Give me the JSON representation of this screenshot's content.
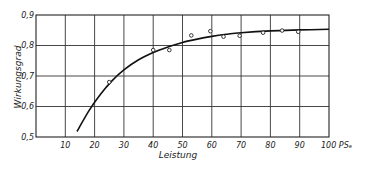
{
  "chart_data": {
    "type": "scatter",
    "title": "",
    "xlabel": "Leistung",
    "ylabel": "Wirkungsgrad",
    "x_unit_label": "PSe",
    "xlim": [
      0,
      100
    ],
    "ylim": [
      0.5,
      0.9
    ],
    "x_ticks": [
      10,
      20,
      30,
      40,
      50,
      60,
      70,
      80,
      90,
      100
    ],
    "x_tick_labels": [
      "10",
      "20",
      "30",
      "40",
      "50",
      "60",
      "70",
      "80",
      "90",
      "100 PSₑ"
    ],
    "y_ticks": [
      0.5,
      0.6,
      0.7,
      0.8,
      0.9
    ],
    "y_tick_labels": [
      "0,5",
      "0,6",
      "0,7",
      "0,8",
      "0,9"
    ],
    "grid": true,
    "legend": null,
    "series": [
      {
        "name": "Messpunkte",
        "type": "scatter",
        "marker": "open-circle",
        "x": [
          25,
          40,
          45.5,
          53,
          59.5,
          64,
          69.5,
          77.5,
          84,
          89.5
        ],
        "y": [
          0.68,
          0.785,
          0.785,
          0.833,
          0.847,
          0.829,
          0.832,
          0.842,
          0.849,
          0.845
        ]
      },
      {
        "name": "Ausgleichskurve",
        "type": "line",
        "x": [
          14,
          18,
          22,
          26,
          30,
          35,
          40,
          45,
          50,
          55,
          60,
          65,
          70,
          80,
          90,
          100
        ],
        "y": [
          0.518,
          0.585,
          0.64,
          0.685,
          0.72,
          0.753,
          0.777,
          0.795,
          0.81,
          0.821,
          0.83,
          0.837,
          0.842,
          0.848,
          0.851,
          0.853
        ]
      }
    ]
  }
}
